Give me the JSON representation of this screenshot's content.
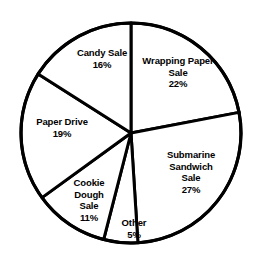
{
  "chart_data": {
    "type": "pie",
    "title": "",
    "subtitle": "",
    "xlabel": "",
    "ylabel": "",
    "legend_position": "none",
    "grid": false,
    "units": "percent",
    "total": 100,
    "start_angle_deg": 0,
    "direction": "clockwise",
    "categories": [
      "Wrapping Paper Sale",
      "Submarine Sandwich Sale",
      "Other",
      "Cookie Dough Sale",
      "Paper Drive",
      "Candy Sale"
    ],
    "values": [
      22,
      27,
      5,
      11,
      19,
      16
    ],
    "slices": [
      {
        "label": "Wrapping Paper Sale",
        "label_lines": [
          "Wrapping Paper",
          "Sale"
        ],
        "value": 22,
        "value_text": "22%",
        "start_deg": 0,
        "end_deg": 79.2,
        "fill": "#ffffff",
        "label_x": 178,
        "label_y": 72
      },
      {
        "label": "Submarine Sandwich Sale",
        "label_lines": [
          "Submarine",
          "Sandwich",
          "Sale"
        ],
        "value": 27,
        "value_text": "27%",
        "start_deg": 79.2,
        "end_deg": 176.4,
        "fill": "#ffffff",
        "label_x": 191,
        "label_y": 172
      },
      {
        "label": "Other",
        "label_lines": [
          "Other"
        ],
        "value": 5,
        "value_text": "5%",
        "start_deg": 176.4,
        "end_deg": 194.4,
        "fill": "#ffffff",
        "label_x": 134,
        "label_y": 228
      },
      {
        "label": "Cookie Dough Sale",
        "label_lines": [
          "Cookie",
          "Dough",
          "Sale"
        ],
        "value": 11,
        "value_text": "11%",
        "start_deg": 194.4,
        "end_deg": 234.0,
        "fill": "#ffffff",
        "label_x": 89,
        "label_y": 200
      },
      {
        "label": "Paper Drive",
        "label_lines": [
          "Paper Drive"
        ],
        "value": 19,
        "value_text": "19%",
        "start_deg": 234.0,
        "end_deg": 302.4,
        "fill": "#ffffff",
        "label_x": 62,
        "label_y": 127
      },
      {
        "label": "Candy Sale",
        "label_lines": [
          "Candy Sale"
        ],
        "value": 16,
        "value_text": "16%",
        "start_deg": 302.4,
        "end_deg": 360,
        "fill": "#ffffff",
        "label_x": 102,
        "label_y": 58
      }
    ],
    "style": {
      "background": "#ffffff",
      "stroke": "#000000",
      "outline_width": 3.2,
      "divider_width": 3.0,
      "center_x": 131,
      "center_y": 133,
      "radius": 110
    }
  }
}
